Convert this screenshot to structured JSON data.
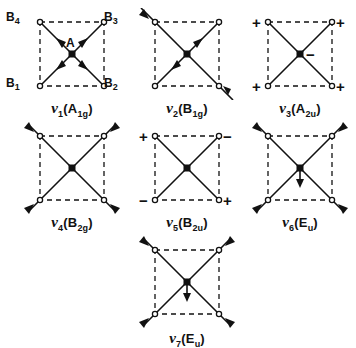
{
  "figure": {
    "caption_note": "",
    "colors": {
      "ink": "#111111",
      "background": "#ffffff"
    }
  },
  "atom_labels": {
    "center": "A",
    "b1": "B",
    "b1_sub": "1",
    "b2": "B",
    "b2_sub": "2",
    "b3": "B",
    "b3_sub": "3",
    "b4": "B",
    "b4_sub": "4"
  },
  "signs": {
    "plus": "+",
    "minus": "−"
  },
  "modes": [
    {
      "id": "nu1",
      "nu": "ν",
      "index": "1",
      "symmetry": "(A",
      "symmetry_sub": "1g",
      "symmetry_close": ")",
      "label_full": "ν1(A1g)",
      "description": "symmetric stretch, all four B atoms move inward toward center A",
      "arrow_style": "in-plane",
      "corner_arrows": [
        "in",
        "in",
        "in",
        "in"
      ],
      "center_arrow": "none",
      "corner_signs": [
        "",
        "",
        "",
        ""
      ],
      "center_sign": ""
    },
    {
      "id": "nu2",
      "nu": "ν",
      "index": "2",
      "symmetry": "(B",
      "symmetry_sub": "1g",
      "symmetry_close": ")",
      "label_full": "ν2(B1g)",
      "description": "one diagonal pair moves outward, other diagonal pair moves inward",
      "arrow_style": "in-plane",
      "corner_arrows": [
        "out",
        "in",
        "out",
        "in"
      ],
      "center_arrow": "none",
      "corner_signs": [
        "",
        "",
        "",
        ""
      ],
      "center_sign": ""
    },
    {
      "id": "nu3",
      "nu": "ν",
      "index": "3",
      "symmetry": "(A",
      "symmetry_sub": "2u",
      "symmetry_close": ")",
      "label_full": "ν3(A2u)",
      "description": "out-of-plane mode, four B atoms positive, central A atom negative",
      "arrow_style": "out-of-plane",
      "corner_arrows": [
        "none",
        "none",
        "none",
        "none"
      ],
      "center_arrow": "none",
      "corner_signs": [
        "+",
        "+",
        "+",
        "+"
      ],
      "center_sign": "−"
    },
    {
      "id": "nu4",
      "nu": "ν",
      "index": "4",
      "symmetry": "(B",
      "symmetry_sub": "2g",
      "symmetry_close": ")",
      "label_full": "ν4(B2g)",
      "description": "all four B atoms move outward along the diagonals",
      "arrow_style": "in-plane",
      "corner_arrows": [
        "out",
        "out",
        "out",
        "out"
      ],
      "center_arrow": "none",
      "corner_signs": [
        "",
        "",
        "",
        ""
      ],
      "center_sign": ""
    },
    {
      "id": "nu5",
      "nu": "ν",
      "index": "5",
      "symmetry": "(B",
      "symmetry_sub": "2u",
      "symmetry_close": ")",
      "label_full": "ν5(B2u)",
      "description": "out-of-plane mode with alternating signs at the corners",
      "arrow_style": "out-of-plane",
      "corner_arrows": [
        "none",
        "none",
        "none",
        "none"
      ],
      "center_arrow": "none",
      "corner_signs": [
        "+",
        "−",
        "−",
        "+"
      ],
      "center_sign": ""
    },
    {
      "id": "nu6",
      "nu": "ν",
      "index": "6",
      "symmetry": "(E",
      "symmetry_sub": "u",
      "symmetry_close": ")",
      "label_full": "ν6(Eu)",
      "description": "B atoms move outward along diagonals while central A atom moves down",
      "arrow_style": "in-plane",
      "corner_arrows": [
        "out",
        "out",
        "out",
        "out"
      ],
      "center_arrow": "down",
      "corner_signs": [
        "",
        "",
        "",
        ""
      ],
      "center_sign": ""
    },
    {
      "id": "nu7",
      "nu": "ν",
      "index": "7",
      "symmetry": "(E",
      "symmetry_sub": "u",
      "symmetry_close": ")",
      "label_full": "ν7(Eu)",
      "description": "B atoms move outward along diagonals with central A atom moving down",
      "arrow_style": "in-plane",
      "corner_arrows": [
        "out",
        "out",
        "out",
        "out"
      ],
      "center_arrow": "down",
      "corner_signs": [
        "",
        "",
        "",
        ""
      ],
      "center_sign": ""
    }
  ]
}
